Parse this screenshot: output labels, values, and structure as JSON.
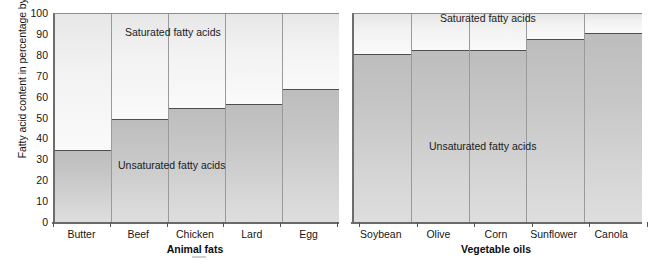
{
  "axes": {
    "y_label": "Fatty acid content in percentage by weight",
    "y_ticks": [
      "100",
      "90",
      "80",
      "70",
      "60",
      "50",
      "40",
      "30",
      "20",
      "10",
      "0"
    ]
  },
  "series_labels": {
    "saturated": "Saturated fatty acids",
    "unsaturated": "Unsaturated fatty acids"
  },
  "panels": {
    "animal": {
      "axis_title": "Animal fats",
      "categories": [
        "Butter",
        "Beef",
        "Chicken",
        "Lard",
        "Egg"
      ]
    },
    "vegetable": {
      "axis_title": "Vegetable oils",
      "categories": [
        "Soybean",
        "Olive",
        "Corn",
        "Sunflower",
        "Canola"
      ]
    }
  },
  "chart_data": [
    {
      "type": "bar",
      "title": "Animal fats",
      "stacked": true,
      "categories": [
        "Butter",
        "Beef",
        "Chicken",
        "Lard",
        "Egg"
      ],
      "series": [
        {
          "name": "Unsaturated fatty acids",
          "values": [
            35,
            50,
            55,
            57,
            64
          ]
        },
        {
          "name": "Saturated fatty acids",
          "values": [
            65,
            50,
            45,
            43,
            36
          ]
        }
      ],
      "xlabel": "Animal fats",
      "ylabel": "Fatty acid content in percentage by weight",
      "ylim": [
        0,
        100
      ],
      "ytick_step": 10,
      "grid": false,
      "legend": "in-plot annotations"
    },
    {
      "type": "bar",
      "title": "Vegetable oils",
      "stacked": true,
      "categories": [
        "Soybean",
        "Olive",
        "Corn",
        "Sunflower",
        "Canola"
      ],
      "series": [
        {
          "name": "Unsaturated fatty acids",
          "values": [
            81,
            83,
            83,
            88,
            91
          ]
        },
        {
          "name": "Saturated fatty acids",
          "values": [
            19,
            17,
            17,
            12,
            9
          ]
        }
      ],
      "xlabel": "Vegetable oils",
      "ylabel": "Fatty acid content in percentage by weight",
      "ylim": [
        0,
        100
      ],
      "ytick_step": 10,
      "grid": false,
      "legend": "in-plot annotations"
    }
  ],
  "colors": {
    "saturated_fill": "#f2f2f2",
    "unsaturated_fill": "#c9c9c9",
    "axis": "#6a6a6a",
    "divider": "#4e4e4e",
    "text": "#161616"
  }
}
